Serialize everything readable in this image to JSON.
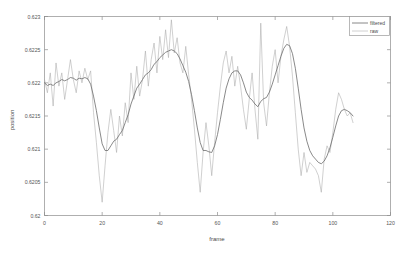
{
  "chart_data": {
    "type": "line",
    "title": "",
    "xlabel": "frame",
    "ylabel": "position",
    "xlim": [
      0,
      120
    ],
    "ylim": [
      0.62,
      0.623
    ],
    "xticks": [
      0,
      20,
      40,
      60,
      80,
      100,
      120
    ],
    "xtick_labels": [
      "0",
      "20",
      "40",
      "60",
      "80",
      "100",
      "120"
    ],
    "yticks": [
      0.62,
      0.6205,
      0.621,
      0.6215,
      0.622,
      0.6225,
      0.623
    ],
    "ytick_labels": [
      "0.62",
      "0.6205",
      "0.621",
      "0.6215",
      "0.622",
      "0.6225",
      "0.623"
    ],
    "grid": false,
    "legend_position": "top-right",
    "legend": [
      "filtered",
      "raw"
    ],
    "x": [
      0,
      1,
      2,
      3,
      4,
      5,
      6,
      7,
      8,
      9,
      10,
      11,
      12,
      13,
      14,
      15,
      16,
      17,
      18,
      19,
      20,
      21,
      22,
      23,
      24,
      25,
      26,
      27,
      28,
      29,
      30,
      31,
      32,
      33,
      34,
      35,
      36,
      37,
      38,
      39,
      40,
      41,
      42,
      43,
      44,
      45,
      46,
      47,
      48,
      49,
      50,
      51,
      52,
      53,
      54,
      55,
      56,
      57,
      58,
      59,
      60,
      61,
      62,
      63,
      64,
      65,
      66,
      67,
      68,
      69,
      70,
      71,
      72,
      73,
      74,
      75,
      76,
      77,
      78,
      79,
      80,
      81,
      82,
      83,
      84,
      85,
      86,
      87,
      88,
      89,
      90,
      91,
      92,
      93,
      94,
      95,
      96,
      97,
      98,
      99,
      100,
      101,
      102,
      103,
      104,
      105,
      106,
      107
    ],
    "series": [
      {
        "name": "raw",
        "color": "#a8a8a8",
        "values": [
          0.62205,
          0.62185,
          0.62215,
          0.62165,
          0.6223,
          0.62195,
          0.62215,
          0.62175,
          0.62205,
          0.62235,
          0.62205,
          0.62185,
          0.62218,
          0.622,
          0.62222,
          0.62205,
          0.62218,
          0.62155,
          0.6211,
          0.6206,
          0.6202,
          0.62075,
          0.62125,
          0.6216,
          0.62128,
          0.62095,
          0.6215,
          0.6212,
          0.6217,
          0.6214,
          0.62215,
          0.62175,
          0.62225,
          0.6218,
          0.62205,
          0.62248,
          0.62195,
          0.62235,
          0.6226,
          0.62215,
          0.6227,
          0.62235,
          0.6228,
          0.62238,
          0.62295,
          0.62245,
          0.62268,
          0.6223,
          0.62215,
          0.62255,
          0.62212,
          0.62175,
          0.6213,
          0.6208,
          0.62035,
          0.62095,
          0.6214,
          0.62105,
          0.6206,
          0.6211,
          0.62155,
          0.62195,
          0.6223,
          0.62248,
          0.62215,
          0.6224,
          0.62195,
          0.62225,
          0.62195,
          0.6216,
          0.6213,
          0.62175,
          0.62215,
          0.6216,
          0.62115,
          0.6229,
          0.6217,
          0.62135,
          0.62185,
          0.62225,
          0.6225,
          0.622,
          0.6224,
          0.62265,
          0.62285,
          0.62255,
          0.6221,
          0.62155,
          0.621,
          0.6206,
          0.62095,
          0.62065,
          0.6208,
          0.62075,
          0.6207,
          0.6206,
          0.62035,
          0.62085,
          0.62105,
          0.62095,
          0.62125,
          0.6216,
          0.62185,
          0.62175,
          0.6216,
          0.6215,
          0.62155,
          0.6214
        ]
      },
      {
        "name": "filtered",
        "color": "#6b6b6b",
        "values": [
          0.622,
          0.62196,
          0.62198,
          0.62196,
          0.622,
          0.62202,
          0.62205,
          0.62203,
          0.62205,
          0.62208,
          0.62207,
          0.62204,
          0.62207,
          0.62206,
          0.62208,
          0.62206,
          0.62198,
          0.6218,
          0.62158,
          0.62132,
          0.62108,
          0.62098,
          0.62098,
          0.62105,
          0.62112,
          0.62115,
          0.62122,
          0.62128,
          0.6214,
          0.62152,
          0.62168,
          0.6218,
          0.62192,
          0.62198,
          0.62205,
          0.62212,
          0.62215,
          0.6222,
          0.62228,
          0.62232,
          0.62238,
          0.62242,
          0.62246,
          0.62248,
          0.6225,
          0.62248,
          0.62244,
          0.62236,
          0.62226,
          0.62216,
          0.62202,
          0.62182,
          0.62158,
          0.62132,
          0.6211,
          0.62098,
          0.62098,
          0.62096,
          0.62095,
          0.62105,
          0.62122,
          0.62145,
          0.6217,
          0.62192,
          0.62206,
          0.62215,
          0.62218,
          0.62218,
          0.62212,
          0.622,
          0.62186,
          0.62178,
          0.62174,
          0.62168,
          0.62164,
          0.62172,
          0.62176,
          0.62178,
          0.62186,
          0.62198,
          0.62212,
          0.62226,
          0.6224,
          0.62252,
          0.62258,
          0.62256,
          0.62244,
          0.62222,
          0.62192,
          0.6216,
          0.62132,
          0.62112,
          0.62098,
          0.6209,
          0.62085,
          0.6208,
          0.62078,
          0.62082,
          0.6209,
          0.62102,
          0.62118,
          0.62135,
          0.6215,
          0.62158,
          0.6216,
          0.62158,
          0.62155,
          0.6215
        ]
      }
    ]
  },
  "axes": {
    "ylabel": "position",
    "xlabel": "frame"
  },
  "legend": {
    "items": [
      {
        "label": "filtered"
      },
      {
        "label": "raw"
      }
    ]
  }
}
